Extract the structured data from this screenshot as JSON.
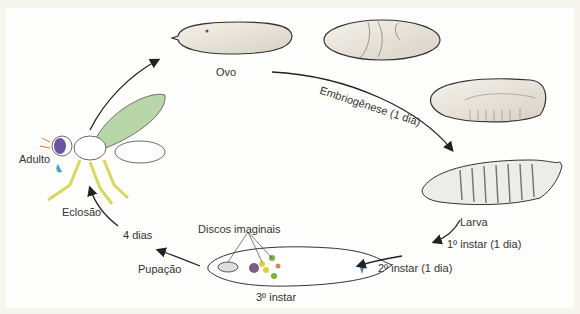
{
  "diagram": {
    "stages": {
      "egg": "Ovo",
      "larva": "Larva",
      "third_instar": "3º instar",
      "adult": "Adulto"
    },
    "transitions": {
      "embryogenesis": "Embriogênese (1 dia)",
      "first_instar": "1º instar (1 dia)",
      "second_instar": "2º instar (1 dia)",
      "pupation": "Pupação",
      "four_days": "4 dias",
      "eclosion": "Eclosão"
    },
    "annotations": {
      "imaginal_discs": "Discos imaginais"
    },
    "colors": {
      "background": "#f7f6ee",
      "egg_fill": "#e8e3d8",
      "wing": "#b9d6a8",
      "legs": "#e8e86a",
      "eye": "#6a55a0",
      "mouth": "#4aa0c8",
      "arrow": "#222222"
    }
  }
}
